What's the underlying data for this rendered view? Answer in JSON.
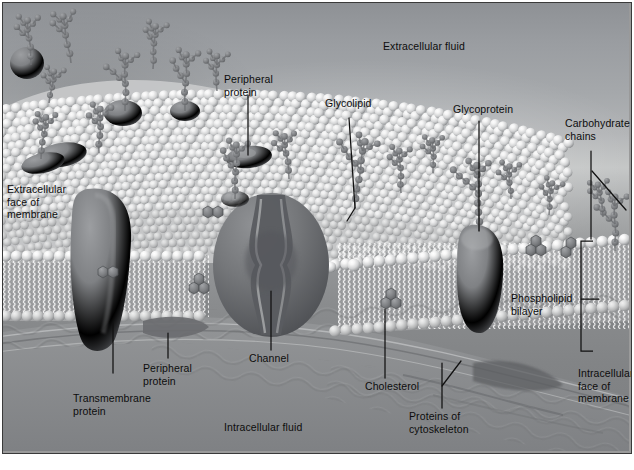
{
  "figure": {
    "colors": {
      "ink": "#111111",
      "leader_line": "#111111",
      "extracellular_bg": "#a5a8ab",
      "intracellular_bg": "#8a8c8e",
      "lipid_head": "#ffffff",
      "protein": "#6f7174",
      "carbohydrate_bead": "#7e8083",
      "border": "#3a3a3a"
    }
  },
  "labels": {
    "extracellular_fluid": "Extracellular fluid",
    "extracellular_face": "Extracellular\nface of\nmembrane",
    "extracellular_face_lines": [
      "Extracellular",
      "face of",
      "membrane"
    ],
    "peripheral_protein_top": "Peripheral\nprotein",
    "peripheral_protein_top_lines": [
      "Peripheral",
      "protein"
    ],
    "glycolipid": "Glycolipid",
    "glycoprotein": "Glycoprotein",
    "carbohydrate_chains": "Carbohydrate\nchains",
    "carbohydrate_chains_lines": [
      "Carbohydrate",
      "chains"
    ],
    "phospholipid_bilayer": "Phospholipid\nbilayer",
    "phospholipid_bilayer_lines": [
      "Phospholipid",
      "bilayer"
    ],
    "intracellular_face": "Intracellular\nface of\nmembrane",
    "intracellular_face_lines": [
      "Intracellular",
      "face of",
      "membrane"
    ],
    "transmembrane_protein": "Transmembrane\nprotein",
    "transmembrane_protein_lines": [
      "Transmembrane",
      "protein"
    ],
    "peripheral_protein_bottom": "Peripheral\nprotein",
    "peripheral_protein_bottom_lines": [
      "Peripheral",
      "protein"
    ],
    "channel": "Channel",
    "cholesterol": "Cholesterol",
    "proteins_of_cytoskeleton": "Proteins of\ncytoskeleton",
    "proteins_of_cytoskeleton_lines": [
      "Proteins of",
      "cytoskeleton"
    ],
    "intracellular_fluid": "Intracellular fluid"
  },
  "structures": [
    {
      "name": "extracellular-fluid-region",
      "kind": "region"
    },
    {
      "name": "intracellular-fluid-region",
      "kind": "region"
    },
    {
      "name": "phospholipid-bilayer",
      "kind": "bilayer"
    },
    {
      "name": "transmembrane-protein",
      "kind": "protein"
    },
    {
      "name": "channel-protein",
      "kind": "protein"
    },
    {
      "name": "glycoprotein",
      "kind": "protein"
    },
    {
      "name": "peripheral-protein",
      "kind": "protein"
    },
    {
      "name": "glycolipid",
      "kind": "lipid"
    },
    {
      "name": "cholesterol",
      "kind": "lipid"
    },
    {
      "name": "carbohydrate-chain",
      "kind": "sugar"
    },
    {
      "name": "cytoskeleton-filaments",
      "kind": "filament"
    }
  ]
}
